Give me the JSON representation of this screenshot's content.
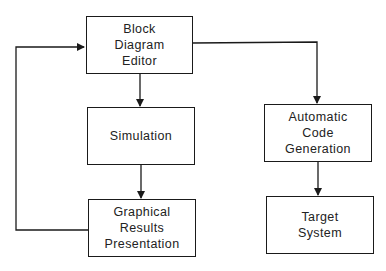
{
  "diagram": {
    "type": "block-flow",
    "blocks": [
      {
        "id": "editor",
        "lines": [
          "Block",
          "Diagram",
          "Editor"
        ]
      },
      {
        "id": "simulation",
        "lines": [
          "Simulation"
        ]
      },
      {
        "id": "graphical",
        "lines": [
          "Graphical",
          "Results",
          "Presentation"
        ]
      },
      {
        "id": "codegen",
        "lines": [
          "Automatic",
          "Code",
          "Generation"
        ]
      },
      {
        "id": "target",
        "lines": [
          "Target",
          "System"
        ]
      }
    ],
    "edges": [
      {
        "from": "editor",
        "to": "simulation"
      },
      {
        "from": "simulation",
        "to": "graphical"
      },
      {
        "from": "graphical",
        "to": "editor",
        "label": "feedback loop"
      },
      {
        "from": "editor",
        "to": "codegen"
      },
      {
        "from": "codegen",
        "to": "target"
      }
    ],
    "colors": {
      "line": "#1a1a1a",
      "background": "#ffffff"
    }
  }
}
